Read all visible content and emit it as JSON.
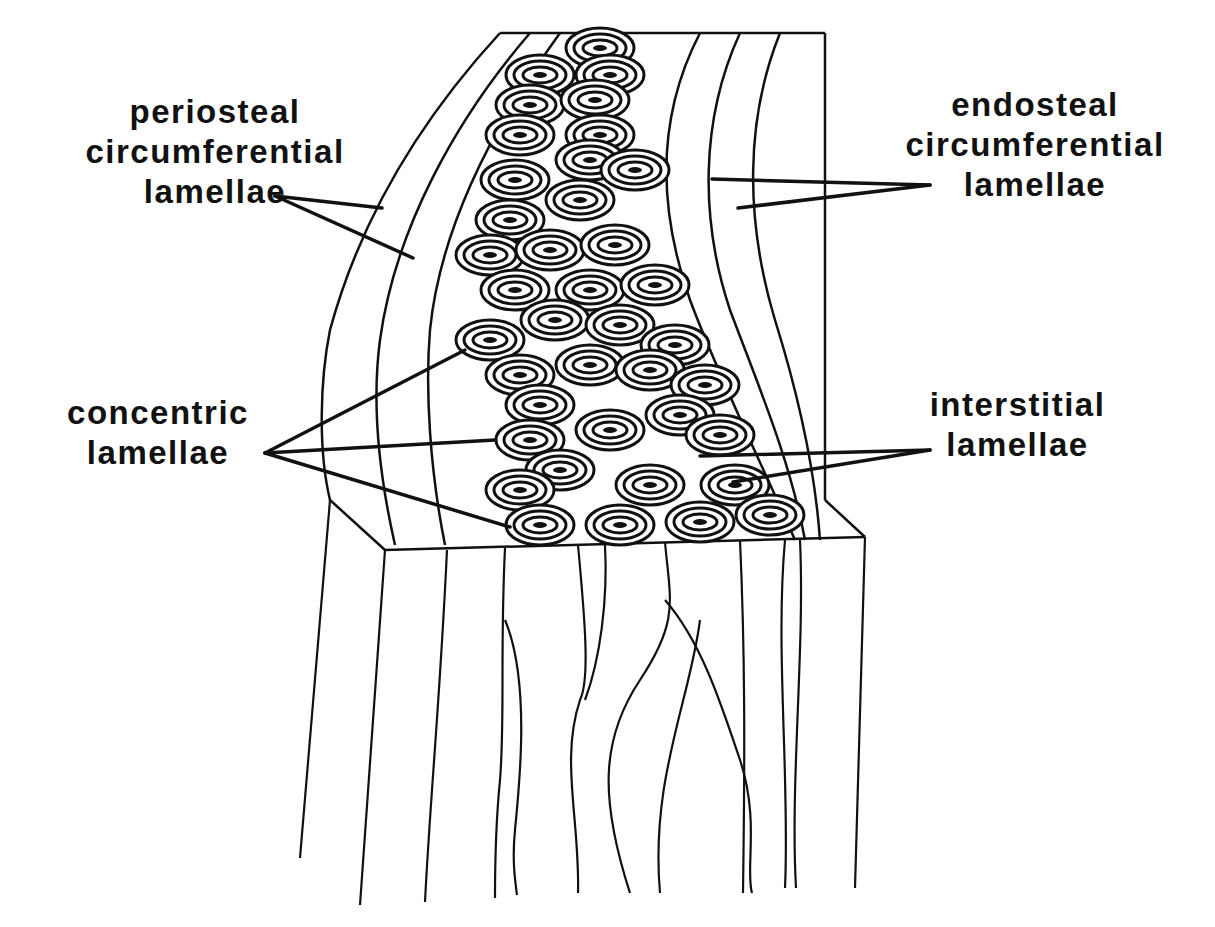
{
  "diagram": {
    "colors": {
      "ink": "#111111",
      "background": "#ffffff"
    },
    "labels": [
      {
        "id": "periosteal",
        "lines": [
          "periosteal",
          "circumferential",
          "lamellae"
        ]
      },
      {
        "id": "endosteal",
        "lines": [
          "endosteal",
          "circumferential",
          "lamellae"
        ]
      },
      {
        "id": "concentric",
        "lines": [
          "concentric",
          "lamellae"
        ]
      },
      {
        "id": "interstitial",
        "lines": [
          "interstitial",
          "lamellae"
        ]
      }
    ]
  }
}
